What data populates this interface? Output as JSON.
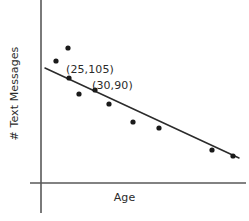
{
  "chart_data": {
    "type": "scatter",
    "title": "",
    "xlabel": "Age",
    "ylabel": "# Text Messages",
    "grid": false,
    "legend": null,
    "axes": {
      "x_axis_shown": true,
      "y_axis_shown": true,
      "x_tick_labels": [],
      "y_tick_labels": [],
      "xlim": [
        0,
        60
      ],
      "ylim": [
        0,
        160
      ]
    },
    "series": [
      {
        "name": "Text messages vs age",
        "marker": "filled-circle",
        "color": "#1a1a1a",
        "points": [
          {
            "x": 10,
            "y": 130
          },
          {
            "x": 17,
            "y": 143
          },
          {
            "x": 18,
            "y": 119
          },
          {
            "x": 23,
            "y": 103
          },
          {
            "x": 25,
            "y": 105
          },
          {
            "x": 30,
            "y": 90
          },
          {
            "x": 34,
            "y": 85
          },
          {
            "x": 41,
            "y": 72
          },
          {
            "x": 56,
            "y": 48
          },
          {
            "x": 67,
            "y": 42
          }
        ]
      }
    ],
    "trend_line": {
      "name": "line of best fit",
      "color": "#2b2b2b",
      "start": {
        "x": 2,
        "y": 123
      },
      "end": {
        "x": 69,
        "y": 45
      }
    },
    "annotations": [
      {
        "id": "label-25-105",
        "text": "(25,105)",
        "points_to": {
          "x": 25,
          "y": 105
        }
      },
      {
        "id": "label-30-90",
        "text": "(30,90)",
        "points_to": {
          "x": 30,
          "y": 90
        }
      }
    ]
  },
  "pixel_geometry": {
    "y_axis_x": 41,
    "y_axis_top": 0,
    "y_axis_bottom": 213,
    "x_axis_y": 183,
    "x_axis_left": 30,
    "x_axis_right": 246,
    "point_radius": 2.6,
    "points_px": [
      {
        "cx": 56,
        "cy": 61
      },
      {
        "cx": 68,
        "cy": 48
      },
      {
        "cx": 69,
        "cy": 78
      },
      {
        "cx": 79,
        "cy": 94
      },
      {
        "cx": 95,
        "cy": 90
      },
      {
        "cx": 109,
        "cy": 104
      },
      {
        "cx": 133,
        "cy": 122
      },
      {
        "cx": 159,
        "cy": 128
      },
      {
        "cx": 212,
        "cy": 150
      },
      {
        "cx": 233,
        "cy": 156
      }
    ],
    "trend_px": {
      "x1": 45,
      "y1": 68,
      "x2": 239,
      "y2": 158
    }
  },
  "colors": {
    "background": "#ffffff",
    "axis": "#595959",
    "marker": "#1a1a1a",
    "trend": "#2b2b2b",
    "text": "#2b2b2b"
  }
}
